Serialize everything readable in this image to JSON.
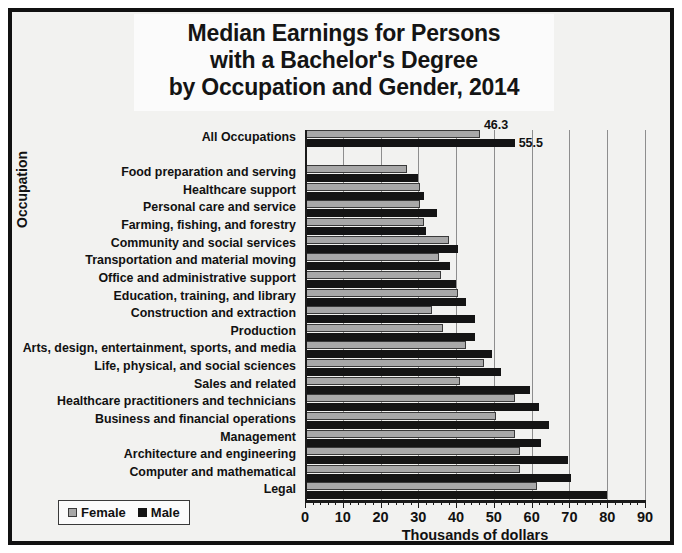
{
  "chart_data": {
    "type": "bar",
    "orientation": "horizontal",
    "title": "Median Earnings for Persons with a Bachelor's Degree by Occupation and Gender, 2014",
    "title_lines": [
      "Median Earnings for Persons",
      "with a Bachelor's Degree",
      "by Occupation and Gender, 2014"
    ],
    "xlabel": "Thousands of dollars",
    "ylabel": "Occupation",
    "xlim": [
      0,
      90
    ],
    "xticks": [
      0,
      10,
      20,
      30,
      40,
      50,
      60,
      70,
      80,
      90
    ],
    "xtick_labels": [
      "0",
      "10",
      "20",
      "30",
      "40",
      "50",
      "60",
      "70",
      "80",
      "90"
    ],
    "grid": true,
    "legend_position": "bottom-left",
    "categories": [
      "All Occupations",
      "",
      "Food preparation and serving",
      "Healthcare support",
      "Personal care and service",
      "Farming, fishing, and forestry",
      "Community and social services",
      "Transportation and material moving",
      "Office and administrative support",
      "Education, training, and library",
      "Construction and extraction",
      "Production",
      "Arts, design, entertainment, sports, and media",
      "Life, physical, and social sciences",
      "Sales and related",
      "Healthcare practitioners and technicians",
      "Business and financial operations",
      "Management",
      "Architecture and engineering",
      "Computer and mathematical",
      "Legal"
    ],
    "series": [
      {
        "name": "Female",
        "color": "#a8a8a8",
        "values": [
          46.3,
          null,
          27.0,
          30.5,
          30.5,
          31.5,
          38.0,
          35.5,
          36.0,
          40.5,
          33.5,
          36.5,
          42.5,
          47.5,
          41.0,
          55.5,
          50.5,
          55.5,
          57.0,
          57.0,
          61.5
        ]
      },
      {
        "name": "Male",
        "color": "#141414",
        "values": [
          55.5,
          null,
          30.0,
          31.5,
          35.0,
          32.0,
          40.5,
          38.5,
          40.0,
          42.5,
          45.0,
          45.0,
          49.5,
          52.0,
          59.5,
          62.0,
          64.5,
          62.5,
          69.5,
          70.5,
          80.0
        ]
      }
    ],
    "annotations": [
      {
        "label": "46.3",
        "series": "Female",
        "category": "All Occupations"
      },
      {
        "label": "55.5",
        "series": "Male",
        "category": "All Occupations"
      }
    ]
  },
  "legend": {
    "items": [
      {
        "label": "Female",
        "swatch": "female-swatch-icon"
      },
      {
        "label": "Male",
        "swatch": "male-swatch-icon"
      }
    ]
  }
}
